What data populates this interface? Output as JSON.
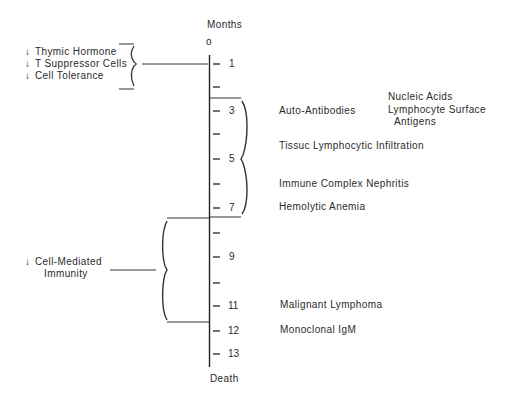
{
  "axis": {
    "title": "Months",
    "origin_label": "o",
    "end_label": "Death",
    "ticks": [
      {
        "month": 1,
        "label": "1"
      },
      {
        "month": 2,
        "label": ""
      },
      {
        "month": 3,
        "label": "3"
      },
      {
        "month": 4,
        "label": ""
      },
      {
        "month": 5,
        "label": "5"
      },
      {
        "month": 6,
        "label": ""
      },
      {
        "month": 7,
        "label": "7"
      },
      {
        "month": 8,
        "label": ""
      },
      {
        "month": 9,
        "label": "9"
      },
      {
        "month": 10,
        "label": ""
      },
      {
        "month": 11,
        "label": "11"
      },
      {
        "month": 12,
        "label": "12"
      },
      {
        "month": 13,
        "label": "13"
      }
    ]
  },
  "left_groups": {
    "early": {
      "arrow": "↓",
      "items": [
        "Thymic Hormone",
        "T Suppressor Cells",
        "Cell Tolerance"
      ],
      "points_to_month": 1
    },
    "late": {
      "arrow": "↓",
      "line1": "Cell-Mediated",
      "line2": "Immunity",
      "span_months": "7–12"
    }
  },
  "right_events": {
    "auto_antibodies": "Auto-Antibodies",
    "auto_antibody_targets": {
      "line1": "Nucleic Acids",
      "line2": "Lymphocyte Surface",
      "line3": "Antigens"
    },
    "tissue_infiltration": "Tissuc Lymphocytic Infiltration",
    "nephritis": "Immune Complex Nephritis",
    "anemia": "Hemolytic Anemia",
    "lymphoma": "Malignant Lymphoma",
    "igm": "Monoclonal IgM",
    "bracket_span_months": "3–7"
  },
  "colors": {
    "ink": "#2a2a2a",
    "background": "#ffffff"
  }
}
